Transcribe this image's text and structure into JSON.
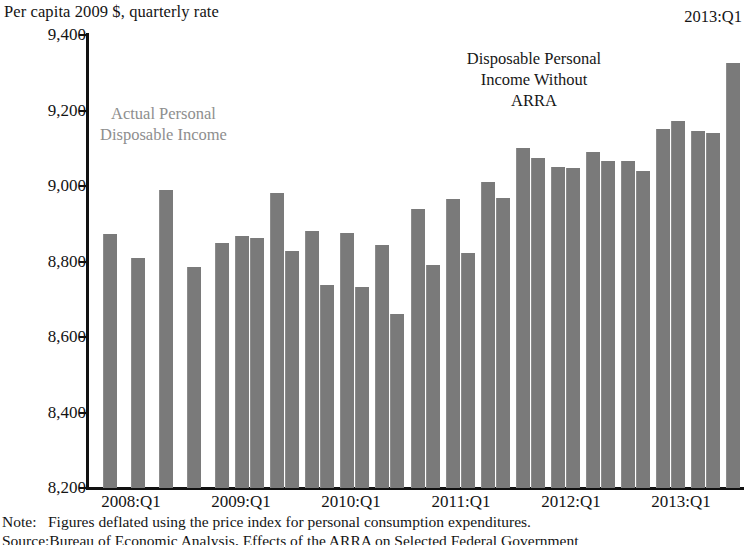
{
  "figure": {
    "units_label": "Per capita 2009 $, quarterly rate",
    "corner_label": "2013:Q1",
    "bar_color": "#7a7a7a",
    "actual_label_color": "#8e8e8e",
    "axis_color": "#111111"
  },
  "annotations": {
    "actual_line1": "Actual Personal",
    "actual_line2": "Disposable Income",
    "without_line1": "Disposable Personal",
    "without_line2": "Income Without",
    "without_line3": "ARRA"
  },
  "notes": {
    "note_lead": "Note:",
    "note_text": "Figures deflated using the price index for personal consumption expenditures.",
    "source_lead": "Source:",
    "source_text": "Bureau of Economic Analysis, Effects of the ARRA on Selected Federal Government"
  },
  "chart_data": {
    "type": "bar",
    "title": "",
    "subtitle": "",
    "xlabel": "",
    "ylabel": "Per capita 2009 $, quarterly rate",
    "ylim": [
      8200,
      9400
    ],
    "yticks": [
      9400,
      9200,
      9000,
      8800,
      8600,
      8400,
      8200
    ],
    "ytick_labels": [
      "9,400",
      "9,200",
      "9,000",
      "8,800",
      "8,600",
      "8,400",
      "8,200"
    ],
    "xtick_labels": [
      "2008:Q1",
      "2009:Q1",
      "2010:Q1",
      "2011:Q1",
      "2012:Q1",
      "2013:Q1"
    ],
    "xtick_quarters": [
      "2008:Q1",
      "2009:Q1",
      "2010:Q1",
      "2011:Q1",
      "2012:Q1",
      "2013:Q1"
    ],
    "grid": false,
    "legend": "annotations-inline",
    "series": [
      {
        "name": "Actual Personal Disposable Income",
        "color": "#7a7a7a",
        "values": [
          8872,
          8808,
          null,
          8785,
          8848,
          8868,
          8828,
          8982,
          8880,
          8738,
          8875,
          8843,
          8940,
          8965,
          9010,
          9100,
          9050,
          9090,
          9065,
          9150,
          9173,
          9146,
          9325,
          9115
        ]
      },
      {
        "name": "Disposable Personal Income Without ARRA",
        "color": "#7a7a7a",
        "values": [
          null,
          null,
          null,
          null,
          null,
          8862,
          null,
          null,
          8733,
          null,
          8733,
          8660,
          null,
          8822,
          8968,
          9074,
          9048,
          9065,
          9040,
          null,
          null,
          null,
          null,
          null
        ]
      }
    ],
    "quarters": [
      "2008:Q1",
      "2008:Q2",
      "2008:Q3",
      "2008:Q4",
      "2009:Q1",
      "2009:Q2",
      "2009:Q3",
      "2009:Q4",
      "2010:Q1",
      "2010:Q2",
      "2010:Q3",
      "2010:Q4",
      "2011:Q1",
      "2011:Q2",
      "2011:Q3",
      "2011:Q4",
      "2012:Q1",
      "2012:Q2",
      "2012:Q3",
      "2012:Q4",
      "2013:Q1"
    ],
    "bars": [
      {
        "x": 14,
        "w": 14,
        "value": 8872
      },
      {
        "x": 42,
        "w": 14,
        "value": 8808
      },
      {
        "x": 70,
        "w": 14,
        "value": 8990
      },
      {
        "x": 98,
        "w": 14,
        "value": 8785
      },
      {
        "x": 126,
        "w": 14,
        "value": 8848
      },
      {
        "x": 146,
        "w": 14,
        "value": 8868
      },
      {
        "x": 161,
        "w": 14,
        "value": 8862
      },
      {
        "x": 181,
        "w": 14,
        "value": 8982
      },
      {
        "x": 196,
        "w": 14,
        "value": 8828
      },
      {
        "x": 216,
        "w": 14,
        "value": 8880
      },
      {
        "x": 231,
        "w": 14,
        "value": 8738
      },
      {
        "x": 251,
        "w": 14,
        "value": 8875
      },
      {
        "x": 266,
        "w": 14,
        "value": 8733
      },
      {
        "x": 286,
        "w": 14,
        "value": 8843
      },
      {
        "x": 301,
        "w": 14,
        "value": 8660
      },
      {
        "x": 322,
        "w": 14,
        "value": 8940
      },
      {
        "x": 337,
        "w": 14,
        "value": 8792
      },
      {
        "x": 357,
        "w": 14,
        "value": 8965
      },
      {
        "x": 372,
        "w": 14,
        "value": 8822
      },
      {
        "x": 392,
        "w": 14,
        "value": 9010
      },
      {
        "x": 407,
        "w": 14,
        "value": 8968
      },
      {
        "x": 427,
        "w": 14,
        "value": 9100
      },
      {
        "x": 442,
        "w": 14,
        "value": 9074
      },
      {
        "x": 462,
        "w": 14,
        "value": 9050
      },
      {
        "x": 477,
        "w": 14,
        "value": 9048
      },
      {
        "x": 497,
        "w": 14,
        "value": 9090
      },
      {
        "x": 512,
        "w": 14,
        "value": 9065
      },
      {
        "x": 532,
        "w": 14,
        "value": 9065
      },
      {
        "x": 547,
        "w": 14,
        "value": 9040
      },
      {
        "x": 567,
        "w": 14,
        "value": 9150
      },
      {
        "x": 582,
        "w": 14,
        "value": 9173
      },
      {
        "x": 602,
        "w": 14,
        "value": 9146
      },
      {
        "x": 617,
        "w": 14,
        "value": 9140
      },
      {
        "x": 637,
        "w": 14,
        "value": 9325
      },
      {
        "x": 662,
        "w": 14,
        "value": 9115
      }
    ],
    "xtick_positions": [
      {
        "label": "2008:Q1",
        "x": 131
      },
      {
        "label": "2009:Q1",
        "x": 241
      },
      {
        "label": "2010:Q1",
        "x": 351
      },
      {
        "label": "2011:Q1",
        "x": 461
      },
      {
        "label": "2012:Q1",
        "x": 571
      },
      {
        "label": "2013:Q1",
        "x": 681
      }
    ]
  }
}
